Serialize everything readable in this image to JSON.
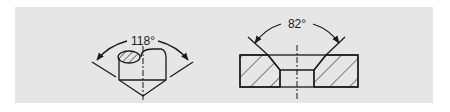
{
  "figure": {
    "background": "#e6e6e6",
    "ink": "#1a1a1a",
    "drill_point": {
      "angle_label": "118°",
      "description": "Drill point with 118° included angle"
    },
    "countersink": {
      "angle_label": "82°",
      "description": "Countersunk hole section with 82° included angle"
    }
  }
}
